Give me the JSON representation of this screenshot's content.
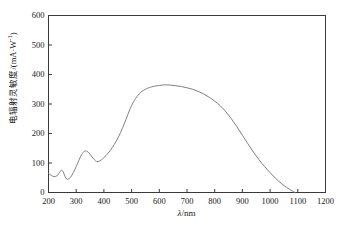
{
  "chart_data": {
    "type": "line",
    "title": "",
    "xlabel": "λ/nm",
    "ylabel": "电辐射灵敏度/(mA·W⁻¹)",
    "ylabel_text": "电辐射灵敏度/(mA·W",
    "ylabel_sup": "-1",
    "ylabel_tail": ")",
    "xlabel_symbol": "λ",
    "xlabel_unit": "/nm",
    "xlim": [
      200,
      1200
    ],
    "ylim": [
      0,
      600
    ],
    "xticks": [
      200,
      300,
      400,
      500,
      600,
      700,
      800,
      900,
      1000,
      1100,
      1200
    ],
    "yticks": [
      0,
      100,
      200,
      300,
      400,
      500,
      600
    ],
    "grid": false,
    "legend": null,
    "series": [
      {
        "name": "spectral radiant sensitivity",
        "color": "#808080",
        "x": [
          200,
          210,
          220,
          230,
          240,
          245,
          250,
          255,
          260,
          265,
          270,
          280,
          290,
          300,
          310,
          320,
          330,
          340,
          350,
          360,
          370,
          375,
          385,
          400,
          415,
          430,
          445,
          460,
          475,
          490,
          500,
          510,
          520,
          535,
          550,
          565,
          580,
          600,
          620,
          640,
          660,
          680,
          700,
          720,
          740,
          760,
          780,
          800,
          820,
          840,
          860,
          880,
          900,
          920,
          940,
          960,
          980,
          1000,
          1020,
          1040,
          1060,
          1080,
          1090
        ],
        "y": [
          65,
          58,
          54,
          56,
          68,
          75,
          74,
          66,
          54,
          46,
          45,
          52,
          68,
          88,
          110,
          129,
          140,
          139,
          130,
          117,
          107,
          105,
          107,
          118,
          133,
          152,
          175,
          203,
          237,
          273,
          295,
          312,
          326,
          341,
          350,
          356,
          360,
          363,
          365,
          364,
          362,
          359,
          355,
          350,
          343,
          334,
          323,
          310,
          294,
          274,
          250,
          223,
          194,
          165,
          137,
          111,
          88,
          67,
          48,
          31,
          17,
          5,
          0
        ]
      }
    ]
  },
  "axes": {
    "y_tick_labels": [
      "600",
      "500",
      "400",
      "300",
      "200",
      "100",
      "0"
    ],
    "x_tick_labels": [
      "200",
      "300",
      "400",
      "500",
      "600",
      "700",
      "800",
      "900",
      "1000",
      "1100",
      "1200"
    ]
  },
  "style": {
    "frame_color": "#3a3a3a",
    "curve_color": "#7f7f7f",
    "background": "#ffffff"
  }
}
